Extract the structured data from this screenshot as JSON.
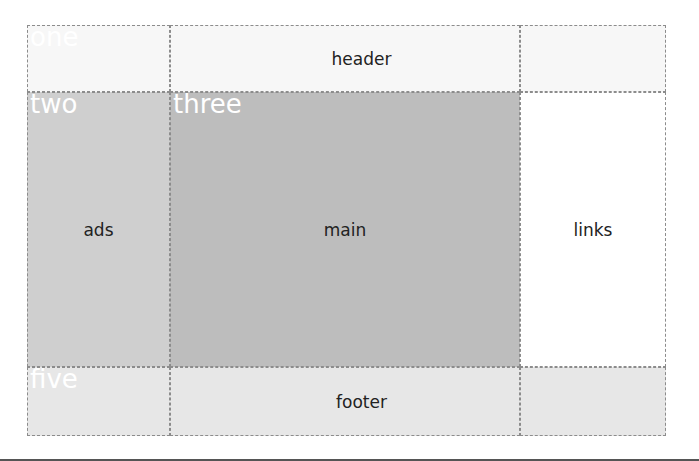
{
  "areas": {
    "header": "header",
    "ads": "ads",
    "main": "main",
    "links": "links",
    "footer": "footer"
  },
  "cell_labels": [
    "one",
    "two",
    "three",
    "four",
    "five",
    "six"
  ],
  "colors": {
    "header_bg": "#f7f7f7",
    "ads_bg": "#cfcfcf",
    "main_bg": "#bdbdbd",
    "links_bg": "#ffffff",
    "footer_bg": "#e7e7e7",
    "grid_line": "#8c8c8c",
    "label_text": "#ffffff"
  }
}
